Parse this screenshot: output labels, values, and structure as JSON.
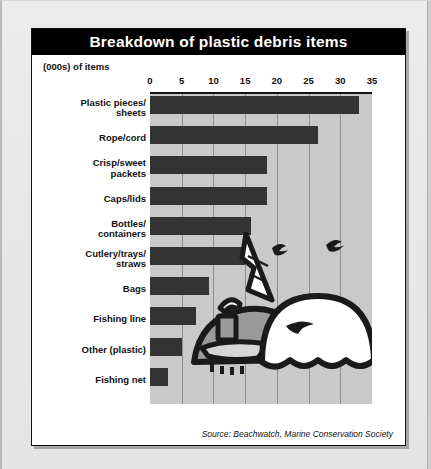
{
  "figure": {
    "title": "Breakdown of plastic debris items",
    "subtitle": "(000s) of items",
    "source": "Source: Beachwatch, Marine Conservation Society"
  },
  "colors": {
    "title_bar": "#000000",
    "title_text": "#ffffff",
    "plot_background": "#c9c9c9",
    "bar": "#333333",
    "gridline": "#8e8e8e",
    "card": "#ffffff",
    "page": "#e8e8e8"
  },
  "chart_data": {
    "type": "bar",
    "orientation": "horizontal",
    "title": "Breakdown of plastic debris items",
    "subtitle": "(000s) of items",
    "xlabel": "(000s) of items",
    "ylabel": "",
    "xlim": [
      0,
      35
    ],
    "xticks": [
      0,
      5,
      10,
      15,
      20,
      25,
      30,
      35
    ],
    "grid": true,
    "legend": false,
    "source": "Source: Beachwatch, Marine Conservation Society",
    "categories": [
      "Plastic pieces/ sheets",
      "Rope/cord",
      "Crisp/sweet packets",
      "Caps/lids",
      "Bottles/ containers",
      "Cutlery/trays/ straws",
      "Bags",
      "Fishing line",
      "Other (plastic)",
      "Fishing net"
    ],
    "category_lines": [
      [
        "Plastic pieces/",
        "sheets"
      ],
      [
        "Rope/cord"
      ],
      [
        "Crisp/sweet",
        "packets"
      ],
      [
        "Caps/lids"
      ],
      [
        "Bottles/",
        "containers"
      ],
      [
        "Cutlery/trays/",
        "straws"
      ],
      [
        "Bags"
      ],
      [
        "Fishing line"
      ],
      [
        "Other (plastic)"
      ],
      [
        "Fishing net"
      ]
    ],
    "values": [
      33,
      26.5,
      18.5,
      18.5,
      16,
      15,
      9.3,
      7.3,
      5.1,
      2.8
    ]
  },
  "artwork": {
    "name": "beached-whale-illustration",
    "description": "Line drawing of a beached whale with a sailing boat, seagulls and waves"
  }
}
